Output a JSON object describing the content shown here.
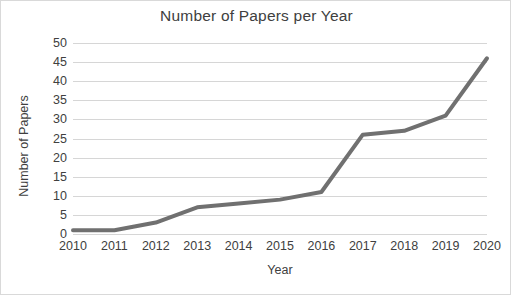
{
  "chart_data": {
    "type": "line",
    "title": "Number of Papers per Year",
    "xlabel": "Year",
    "ylabel": "Number of Papers",
    "categories": [
      "2010",
      "2011",
      "2012",
      "2013",
      "2014",
      "2015",
      "2016",
      "2017",
      "2018",
      "2019",
      "2020"
    ],
    "x": [
      2010,
      2011,
      2012,
      2013,
      2014,
      2015,
      2016,
      2017,
      2018,
      2019,
      2020
    ],
    "values": [
      1,
      1,
      3,
      7,
      8,
      9,
      11,
      26,
      27,
      31,
      46
    ],
    "series": [
      {
        "name": "Number of Papers",
        "values": [
          1,
          1,
          3,
          7,
          8,
          9,
          11,
          26,
          27,
          31,
          46
        ]
      }
    ],
    "ylim": [
      0,
      50
    ],
    "ytick_labels": [
      "0",
      "5",
      "10",
      "15",
      "20",
      "25",
      "30",
      "35",
      "40",
      "45",
      "50"
    ],
    "yticks": [
      0,
      5,
      10,
      15,
      20,
      25,
      30,
      35,
      40,
      45,
      50
    ],
    "xlim": [
      2010,
      2020
    ],
    "grid": "horizontal",
    "legend": "none",
    "markers": "none",
    "line_color": "#707070",
    "line_width": 4,
    "grid_color": "#d6d6d6",
    "text_color": "#404040",
    "background": "#ffffff",
    "border_color": "#d9d9d9"
  }
}
